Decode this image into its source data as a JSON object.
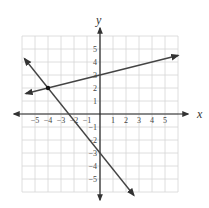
{
  "chart_data": {
    "type": "line",
    "title": "",
    "xlabel": "x",
    "ylabel": "y",
    "xlim": [
      -6,
      6
    ],
    "ylim": [
      -6,
      6
    ],
    "grid": true,
    "x_ticks": [
      -5,
      -4,
      -3,
      -2,
      -1,
      1,
      2,
      3,
      4,
      5
    ],
    "y_ticks": [
      5,
      4,
      3,
      2,
      1,
      -1,
      -2,
      -3,
      -4,
      -5
    ],
    "series": [
      {
        "name": "line-1",
        "equation": "y = 0.25x + 3",
        "points": [
          [
            -5.7,
            1.575
          ],
          [
            6,
            4.5
          ]
        ],
        "arrows": "both"
      },
      {
        "name": "line-2",
        "equation": "y = -1.25x - 3",
        "points": [
          [
            -5.8,
            4.25
          ],
          [
            2.6,
            -6.25
          ]
        ],
        "arrows": "both"
      }
    ],
    "annotations": [
      {
        "type": "point",
        "label": "intersection",
        "x": -4,
        "y": 2
      }
    ]
  },
  "colors": {
    "grid": "#d6d6d6",
    "axis": "#222222",
    "line": "#444444"
  }
}
